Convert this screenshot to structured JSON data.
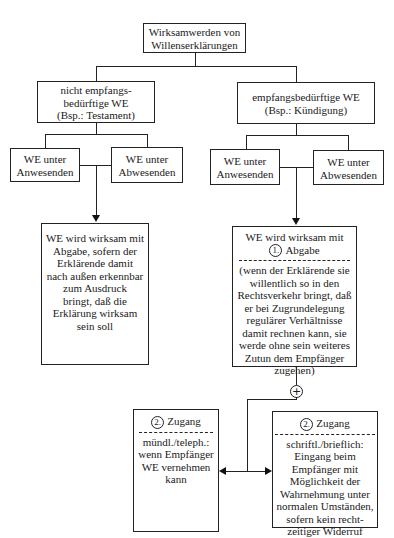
{
  "root": {
    "text": "Wirksamwerden von\nWillenserklärungen"
  },
  "left_branch": {
    "title": "nicht empfangs-\nbedürftige WE\n(Bsp.: Testament)",
    "sub_a": "WE unter\nAnwesenden",
    "sub_b": "WE unter\nAbwesenden",
    "result": "WE wird wirksam mit\nAbgabe, sofern der\nErklärende damit\nnach außen erkennbar\nzum Ausdruck\nbringt, daß die\nErklärung wirksam\nsein soll"
  },
  "right_branch": {
    "title": "empfangsbedürftige WE\n(Bsp.: Kündigung)",
    "sub_a": "WE unter\nAnwesenden",
    "sub_b": "WE unter\nAbwesenden",
    "result_head": "WE wird wirksam mit",
    "step1_number": "1.",
    "step1_label": "Abgabe",
    "result_detail": "(wenn der Erklärende sie\nwillentlich so in den\nRechtsverkehr bringt, daß\ner bei Zugrundelegung\nregulärer Verhältnisse\ndamit rechnen kann, sie\nwerde ohne sein weiteres\nZutun dem Empfänger\nzugehen)",
    "plus_symbol": "+",
    "zugang_left": {
      "number": "2.",
      "label": "Zugang",
      "text": "mündl./teleph.:\nwenn Empfänger\nWE vernehmen\nkann"
    },
    "zugang_right": {
      "number": "2.",
      "label": "Zugang",
      "text": "schriftl./brieflich:\nEingang beim\nEmpfänger mit\nMöglichkeit der\nWahrnehmung unter\nnormalen Umständen,\nsofern kein recht-\nzeitiger Widerruf"
    }
  }
}
